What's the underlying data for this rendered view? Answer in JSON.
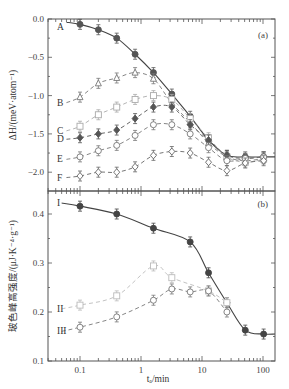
{
  "chart_data": [
    {
      "panel": "(a)",
      "type": "scatter",
      "title": "",
      "xlabel": "t_a/min",
      "ylabel": "ΔH/(meV·atom⁻¹)",
      "xscale": "log",
      "xlim": [
        0.03,
        150
      ],
      "ylim": [
        -2.25,
        0.0
      ],
      "yticks": [
        "0.0",
        "-0.5",
        "-1.0",
        "-1.5",
        "-2.0"
      ],
      "grid": false,
      "x": [
        0.1,
        0.2,
        0.4,
        0.8,
        1.6,
        3.2,
        6.4,
        12.8,
        25.6,
        51.2,
        102.4
      ],
      "series": [
        {
          "name": "A",
          "marker": "circle-filled",
          "fit": "solid",
          "color": "#555555",
          "values": [
            -0.07,
            -0.14,
            -0.25,
            -0.46,
            -0.7,
            -0.98,
            -1.27,
            -1.58,
            -1.78,
            -1.8,
            -1.8
          ]
        },
        {
          "name": "B",
          "marker": "triangle-open",
          "fit": "dashed",
          "color": "#777777",
          "values": [
            -1.02,
            -0.84,
            -0.77,
            -0.7,
            -0.78,
            -1.1,
            -1.35,
            -1.62,
            -1.8,
            -1.85,
            -1.82
          ]
        },
        {
          "name": "C",
          "marker": "square-open",
          "fit": "dashed",
          "color": "#aaaaaa",
          "values": [
            -1.4,
            -1.25,
            -1.15,
            -1.05,
            -1.0,
            -1.05,
            -1.3,
            -1.55,
            -1.8,
            -1.87,
            -1.83
          ]
        },
        {
          "name": "D",
          "marker": "diamond-filled",
          "fit": "dashed",
          "color": "#555555",
          "values": [
            -1.55,
            -1.5,
            -1.45,
            -1.3,
            -1.15,
            -1.15,
            -1.38,
            -1.58,
            -1.78,
            -1.82,
            -1.8
          ]
        },
        {
          "name": "E",
          "marker": "circle-open",
          "fit": "dashed",
          "color": "#777777",
          "values": [
            -1.8,
            -1.72,
            -1.65,
            -1.52,
            -1.38,
            -1.38,
            -1.5,
            -1.68,
            -1.85,
            -1.82,
            -1.8
          ]
        },
        {
          "name": "F",
          "marker": "diamond-open",
          "fit": "dashed",
          "color": "#666666",
          "values": [
            -2.05,
            -2.0,
            -2.0,
            -1.93,
            -1.78,
            -1.73,
            -1.75,
            -1.87,
            -1.98,
            -1.88,
            -1.85
          ]
        }
      ]
    },
    {
      "panel": "(b)",
      "type": "scatter",
      "title": "",
      "xlabel": "t_a/min",
      "ylabel": "玻色峰高强度/(μJ·K⁻⁴·g⁻¹)",
      "xscale": "log",
      "xlim": [
        0.03,
        150
      ],
      "ylim": [
        0.1,
        0.447
      ],
      "yticks": [
        "0.1",
        "0.2",
        "0.3",
        "0.4"
      ],
      "xticks": [
        "0.1",
        "1",
        "10",
        "100"
      ],
      "grid": false,
      "x": [
        0.1,
        0.4,
        1.6,
        3.2,
        6.4,
        12.8,
        25.6,
        51.2,
        102.4
      ],
      "series": [
        {
          "name": "I",
          "marker": "circle-filled",
          "fit": "solid",
          "color": "#444444",
          "values": [
            0.416,
            0.4,
            0.371,
            null,
            0.343,
            0.28,
            0.219,
            0.163,
            0.155
          ]
        },
        {
          "name": "II",
          "marker": "square-open",
          "fit": "dashed",
          "color": "#bbbbbb",
          "values": [
            0.214,
            0.233,
            0.294,
            0.27,
            null,
            0.243,
            0.219,
            null,
            null
          ]
        },
        {
          "name": "III",
          "marker": "circle-open",
          "fit": "dashed",
          "color": "#777777",
          "values": [
            0.169,
            0.19,
            0.224,
            0.247,
            0.241,
            0.243,
            0.2,
            null,
            null
          ]
        }
      ]
    }
  ],
  "labels": {
    "panel_a": "(a)",
    "panel_b": "(b)",
    "ylabel_a": "ΔH/(meV·atom⁻¹)",
    "ylabel_b": "玻色峰高强度/(μJ·K⁻⁴·g⁻¹)",
    "xlabel": "tₐ/min",
    "yticks_a": [
      "0.0",
      "−0.5",
      "−1.0",
      "−1.5",
      "−2.0"
    ],
    "yticks_b": [
      "0.4",
      "0.3",
      "0.2",
      "0.1"
    ],
    "xticks": [
      "0.1",
      "1",
      "10",
      "100"
    ],
    "series_a": [
      "A",
      "B",
      "C",
      "D",
      "E",
      "F"
    ],
    "series_b": [
      "I",
      "II",
      "III"
    ]
  }
}
